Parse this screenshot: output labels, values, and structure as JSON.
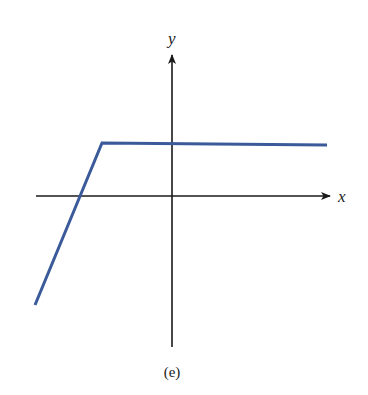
{
  "chart_data": {
    "type": "line",
    "title": "",
    "caption": "(e)",
    "xlabel": "x",
    "ylabel": "y",
    "grid": false,
    "legend": null,
    "axes": {
      "origin_px": [
        172,
        196
      ],
      "x_range_px": [
        36,
        330
      ],
      "y_range_px": [
        53,
        347
      ]
    },
    "series": [
      {
        "name": "piecewise-linear function",
        "color": "#3a5a9a",
        "points_px": [
          [
            35,
            305
          ],
          [
            102,
            143
          ],
          [
            327,
            145
          ]
        ],
        "description": "Steep increasing line from lower-left, crossing x-axis left of origin, then a horizontal segment above the x-axis extending to the right"
      }
    ]
  },
  "labels": {
    "x_axis": "x",
    "y_axis": "y",
    "caption": "(e)"
  },
  "colors": {
    "curve": "#3a5a9a",
    "axes": "#1a1a1a"
  }
}
